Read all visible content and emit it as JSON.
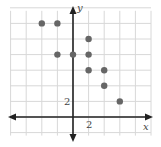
{
  "chart_data": {
    "type": "scatter",
    "title": "",
    "xlabel": "x",
    "ylabel": "y",
    "tick_labels": {
      "x": "2",
      "y": "2"
    },
    "grid_step": 2,
    "grid": true,
    "xlim": [
      -8,
      10
    ],
    "ylim": [
      -2,
      14
    ],
    "points": [
      {
        "x": -4,
        "y": 12
      },
      {
        "x": -2,
        "y": 12
      },
      {
        "x": 2,
        "y": 10
      },
      {
        "x": -2,
        "y": 8
      },
      {
        "x": 0,
        "y": 8
      },
      {
        "x": 2,
        "y": 8
      },
      {
        "x": 2,
        "y": 6
      },
      {
        "x": 4,
        "y": 6
      },
      {
        "x": 4,
        "y": 4
      },
      {
        "x": 6,
        "y": 2
      }
    ],
    "colors": {
      "grid": "#d8d8d8",
      "axis": "#222222",
      "point": "#666666"
    }
  },
  "labels": {
    "x_axis": "x",
    "y_axis": "y",
    "x_tick": "2",
    "y_tick": "2"
  }
}
